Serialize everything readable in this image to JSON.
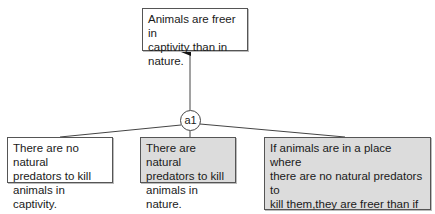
{
  "diagram": {
    "conclusion": {
      "text": "Animals are freer in\ncaptivity than in nature.",
      "fill": "#ffffff"
    },
    "argument_node": {
      "label": "a1"
    },
    "premises": [
      {
        "text": "There are no natural\npredators to kill\nanimals  in captivity.",
        "fill": "#ffffff"
      },
      {
        "text": "There are natural\npredators to kill\nanimals in nature.",
        "fill": "#dcdcdc"
      },
      {
        "text": "If animals are in a place where\nthere are no natural predators to\nkill them,they are freer than if\nthey are in a place where there\nare natural predators to kill them.",
        "fill": "#dcdcdc"
      }
    ],
    "colors": {
      "line": "#444444",
      "white_box": "#ffffff",
      "gray_box": "#dcdcdc"
    }
  }
}
